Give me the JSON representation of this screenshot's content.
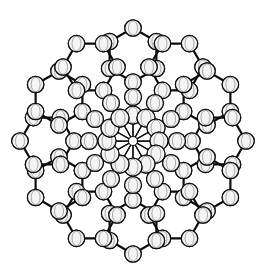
{
  "figure": {
    "background_color": "#ffffff",
    "bond_color": "#0d0d0d",
    "atom_fill_color": "#f4f4f4",
    "atom_outline_color": "#111111",
    "width": 271,
    "height": 267
  },
  "structure": {
    "type": "ball-and-stick",
    "core_label": "metal-cluster-core",
    "core_center": {
      "x": 133,
      "y": 141
    },
    "core_center_radius": 4.5,
    "core_vertex_radius": 9.0,
    "phenyl_atom_radius": 8.2,
    "ipso_atom_radius": 8.4,
    "core_vertex_count": 12,
    "phenyl_ring_count": 12,
    "phenyl_ring_size": 6,
    "core_ring_radius": 26,
    "ipso_ring_radius": 44,
    "phenyl_center_radius": 86,
    "phenyl_ring_radius": 27,
    "rotation_offset_deg": -90,
    "core_vertices": [
      {
        "id": "M1",
        "angle_deg": -90,
        "x": 133,
        "y": 115
      },
      {
        "id": "M2",
        "angle_deg": -60,
        "x": 146,
        "y": 118
      },
      {
        "id": "M3",
        "angle_deg": -30,
        "x": 156,
        "y": 128
      },
      {
        "id": "M4",
        "angle_deg": 0,
        "x": 159,
        "y": 141
      },
      {
        "id": "M5",
        "angle_deg": 30,
        "x": 156,
        "y": 154
      },
      {
        "id": "M6",
        "angle_deg": 60,
        "x": 146,
        "y": 164
      },
      {
        "id": "M7",
        "angle_deg": 90,
        "x": 133,
        "y": 167
      },
      {
        "id": "M8",
        "angle_deg": 120,
        "x": 120,
        "y": 164
      },
      {
        "id": "M9",
        "angle_deg": 150,
        "x": 110,
        "y": 154
      },
      {
        "id": "M10",
        "angle_deg": 180,
        "x": 107,
        "y": 141
      },
      {
        "id": "M11",
        "angle_deg": 210,
        "x": 110,
        "y": 128
      },
      {
        "id": "M12",
        "angle_deg": 240,
        "x": 120,
        "y": 118
      }
    ],
    "ligands": [
      {
        "id": "Ph1",
        "angle_deg": -90,
        "ipso": {
          "x": 133,
          "y": 97
        },
        "ring_center": {
          "x": 133,
          "y": 55
        }
      },
      {
        "id": "Ph2",
        "angle_deg": -60,
        "ipso": {
          "x": 155,
          "y": 103
        },
        "ring_center": {
          "x": 176,
          "y": 67
        }
      },
      {
        "id": "Ph3",
        "angle_deg": -30,
        "ipso": {
          "x": 171,
          "y": 119
        },
        "ring_center": {
          "x": 207,
          "y": 98
        }
      },
      {
        "id": "Ph4",
        "angle_deg": 0,
        "ipso": {
          "x": 177,
          "y": 141
        },
        "ring_center": {
          "x": 219,
          "y": 141
        }
      },
      {
        "id": "Ph5",
        "angle_deg": 30,
        "ipso": {
          "x": 171,
          "y": 163
        },
        "ring_center": {
          "x": 207,
          "y": 184
        }
      },
      {
        "id": "Ph6",
        "angle_deg": 60,
        "ipso": {
          "x": 155,
          "y": 179
        },
        "ring_center": {
          "x": 176,
          "y": 215
        }
      },
      {
        "id": "Ph7",
        "angle_deg": 90,
        "ipso": {
          "x": 133,
          "y": 185
        },
        "ring_center": {
          "x": 133,
          "y": 227
        }
      },
      {
        "id": "Ph8",
        "angle_deg": 120,
        "ipso": {
          "x": 111,
          "y": 179
        },
        "ring_center": {
          "x": 90,
          "y": 215
        }
      },
      {
        "id": "Ph9",
        "angle_deg": 150,
        "ipso": {
          "x": 95,
          "y": 163
        },
        "ring_center": {
          "x": 59,
          "y": 184
        }
      },
      {
        "id": "Ph10",
        "angle_deg": 180,
        "ipso": {
          "x": 89,
          "y": 141
        },
        "ring_center": {
          "x": 47,
          "y": 141
        }
      },
      {
        "id": "Ph11",
        "angle_deg": 210,
        "ipso": {
          "x": 95,
          "y": 119
        },
        "ring_center": {
          "x": 59,
          "y": 98
        }
      },
      {
        "id": "Ph12",
        "angle_deg": 240,
        "ipso": {
          "x": 111,
          "y": 103
        },
        "ring_center": {
          "x": 90,
          "y": 67
        }
      }
    ]
  }
}
